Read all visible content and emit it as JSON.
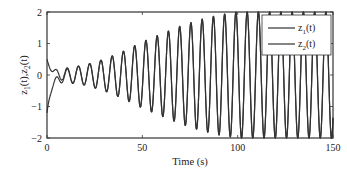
{
  "chart_data": {
    "type": "line",
    "title": "",
    "xlabel": "Time (s)",
    "ylabel": "z1(t),z2(t)",
    "ylabel_parts": {
      "a": "z",
      "a_sub": "1",
      "b": "(t),z",
      "b_sub": "2",
      "c": "(t)"
    },
    "xlim": [
      0,
      150
    ],
    "ylim": [
      -2,
      2
    ],
    "xticks": [
      0,
      50,
      100,
      150
    ],
    "xtick_labels": [
      "0",
      "50",
      "100",
      "150"
    ],
    "yticks": [
      -2,
      -1,
      0,
      1,
      2
    ],
    "ytick_labels": [
      "−2",
      "−1",
      "0",
      "1",
      "2"
    ],
    "grid": false,
    "legend_position": "upper right",
    "oscillation_period_s": 5.9,
    "saturation_level": 2,
    "series": [
      {
        "name": "z1(t)",
        "label_main": "z",
        "label_sub": "1",
        "label_tail": "(t)",
        "color": "#333333",
        "initial_value": 0.5,
        "description": "starts near 0.5, decays to ~0 by t=6, then oscillates with growing amplitude, saturating at ±2 after ~t=95",
        "envelope": [
          [
            0,
            0.05
          ],
          [
            10,
            0.22
          ],
          [
            20,
            0.32
          ],
          [
            30,
            0.5
          ],
          [
            40,
            0.75
          ],
          [
            50,
            1.05
          ],
          [
            60,
            1.3
          ],
          [
            70,
            1.55
          ],
          [
            80,
            1.75
          ],
          [
            90,
            1.9
          ],
          [
            100,
            2.0
          ],
          [
            150,
            2.0
          ]
        ]
      },
      {
        "name": "z2(t)",
        "label_main": "z",
        "label_sub": "2",
        "label_tail": "(t)",
        "color": "#333333",
        "initial_value": -1.0,
        "description": "starts near -1, rises to ~-0.2 by t=5, then merges with z1 in the growing oscillation",
        "envelope": [
          [
            0,
            0.05
          ],
          [
            10,
            0.22
          ],
          [
            20,
            0.32
          ],
          [
            30,
            0.5
          ],
          [
            40,
            0.75
          ],
          [
            50,
            1.05
          ],
          [
            60,
            1.3
          ],
          [
            70,
            1.55
          ],
          [
            80,
            1.75
          ],
          [
            90,
            1.9
          ],
          [
            100,
            2.0
          ],
          [
            150,
            2.0
          ]
        ]
      }
    ]
  }
}
